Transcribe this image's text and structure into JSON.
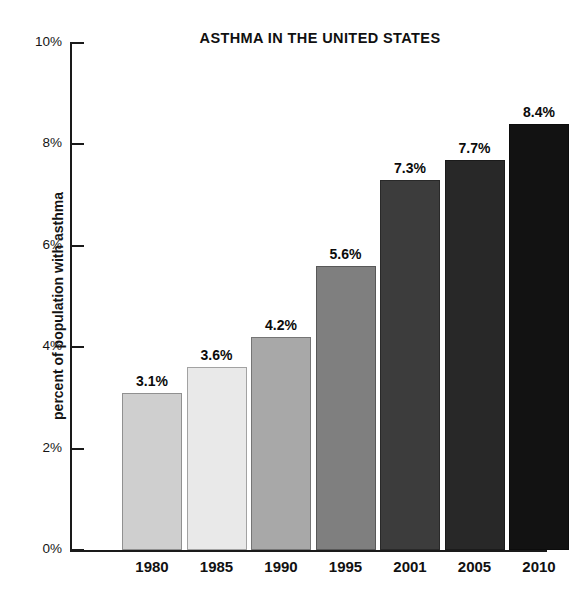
{
  "chart_data": {
    "type": "bar",
    "title": "ASTHMA IN THE UNITED STATES",
    "xlabel": "",
    "ylabel": "percent of population with asthma",
    "categories": [
      "1980",
      "1985",
      "1990",
      "1995",
      "2001",
      "2005",
      "2010"
    ],
    "values": [
      3.1,
      3.6,
      4.2,
      5.6,
      7.3,
      7.7,
      8.4
    ],
    "value_labels": [
      "3.1%",
      "3.6%",
      "4.2%",
      "5.6%",
      "7.3%",
      "7.7%",
      "8.4%"
    ],
    "bar_colors": [
      "#cfcfcf",
      "#e9e9e9",
      "#a8a8a8",
      "#7f7f7f",
      "#3c3c3c",
      "#282828",
      "#121212"
    ],
    "ylim": [
      0,
      10
    ],
    "ytick_values": [
      10,
      8,
      6,
      4,
      2,
      0
    ],
    "ytick_labels": [
      "10%",
      "8%",
      "6%",
      "4%",
      "2%",
      "0%"
    ],
    "grid": false,
    "legend": "none",
    "background_color": "#ffffff",
    "axis_color": "#1a1a1a"
  }
}
